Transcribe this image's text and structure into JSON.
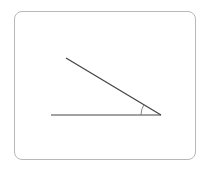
{
  "diagram": {
    "type": "angle",
    "frame": {
      "border_color": "#b8b8b8",
      "background": "#ffffff"
    },
    "vertex": {
      "x": 161,
      "y": 115
    },
    "rays": [
      {
        "name": "horizontal-ray",
        "x1": 51,
        "y1": 115,
        "x2": 161,
        "y2": 115
      },
      {
        "name": "inclined-ray",
        "x1": 66,
        "y1": 58,
        "x2": 161,
        "y2": 115
      }
    ],
    "angle_arc": {
      "radius": 20,
      "color": "#777777"
    },
    "line_color": "#444444",
    "labels": []
  }
}
